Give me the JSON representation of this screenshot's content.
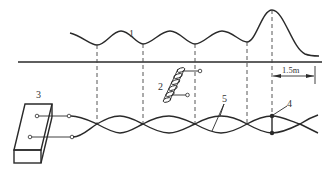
{
  "diagram": {
    "labels": {
      "curve": "1",
      "coil": "2",
      "box": "3",
      "node": "4",
      "wires": "5"
    },
    "dimension": "1.5m",
    "colors": {
      "line": "#2a2a2a",
      "background": "#ffffff"
    },
    "elements": [
      {
        "id": "1",
        "desc": "wave curve above ground line"
      },
      {
        "id": "2",
        "desc": "coil with two terminals"
      },
      {
        "id": "3",
        "desc": "box with two terminal outputs"
      },
      {
        "id": "4",
        "desc": "node point on twisted wires"
      },
      {
        "id": "5",
        "desc": "twisted pair wires"
      }
    ]
  }
}
